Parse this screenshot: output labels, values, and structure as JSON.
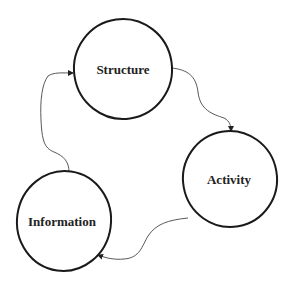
{
  "diagram": {
    "type": "cycle",
    "nodes": [
      {
        "id": "structure",
        "label": "Structure"
      },
      {
        "id": "activity",
        "label": "Activity"
      },
      {
        "id": "information",
        "label": "Information"
      }
    ],
    "edges": [
      {
        "from": "structure",
        "to": "activity"
      },
      {
        "from": "activity",
        "to": "information"
      },
      {
        "from": "information",
        "to": "structure"
      }
    ]
  }
}
